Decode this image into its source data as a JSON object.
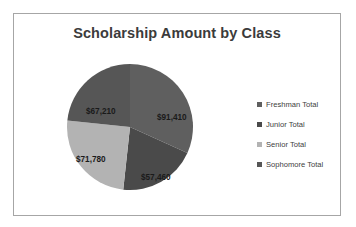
{
  "chart_data": {
    "type": "pie",
    "title": "Scholarship Amount by Class",
    "categories": [
      "Freshman Total",
      "Junior Total",
      "Senior Total",
      "Sophomore Total"
    ],
    "values": [
      91410,
      57460,
      71780,
      67210
    ],
    "data_labels": [
      "$91,410",
      "$57,460",
      "$71,780",
      "$67,210"
    ],
    "colors": [
      "#5f5f5f",
      "#4a4a4a",
      "#b3b3b3",
      "#565656"
    ],
    "legend_position": "right",
    "grid": false,
    "xlabel": "",
    "ylabel": "",
    "total": 287860,
    "slices": [
      {
        "name": "Freshman Total",
        "value": 91410,
        "label": "$91,410",
        "color": "#5f5f5f",
        "start_angle": 0,
        "end_angle": 114.3
      },
      {
        "name": "Junior Total",
        "value": 57460,
        "label": "$57,460",
        "color": "#4a4a4a",
        "start_angle": 114.3,
        "end_angle": 186.2
      },
      {
        "name": "Senior Total",
        "value": 71780,
        "label": "$71,780",
        "color": "#b3b3b3",
        "start_angle": 186.2,
        "end_angle": 276.0
      },
      {
        "name": "Sophomore Total",
        "value": 67210,
        "label": "$67,210",
        "color": "#565656",
        "start_angle": 276.0,
        "end_angle": 360
      }
    ]
  },
  "chart": {
    "title": "Scholarship Amount by Class",
    "border_color": "#a6a6a6",
    "background": "#ffffff"
  },
  "legend": {
    "items": [
      {
        "label": "Freshman Total",
        "color": "#5f5f5f"
      },
      {
        "label": "Junior Total",
        "color": "#4a4a4a"
      },
      {
        "label": "Senior Total",
        "color": "#b3b3b3"
      },
      {
        "label": "Sophomore Total",
        "color": "#565656"
      }
    ]
  }
}
